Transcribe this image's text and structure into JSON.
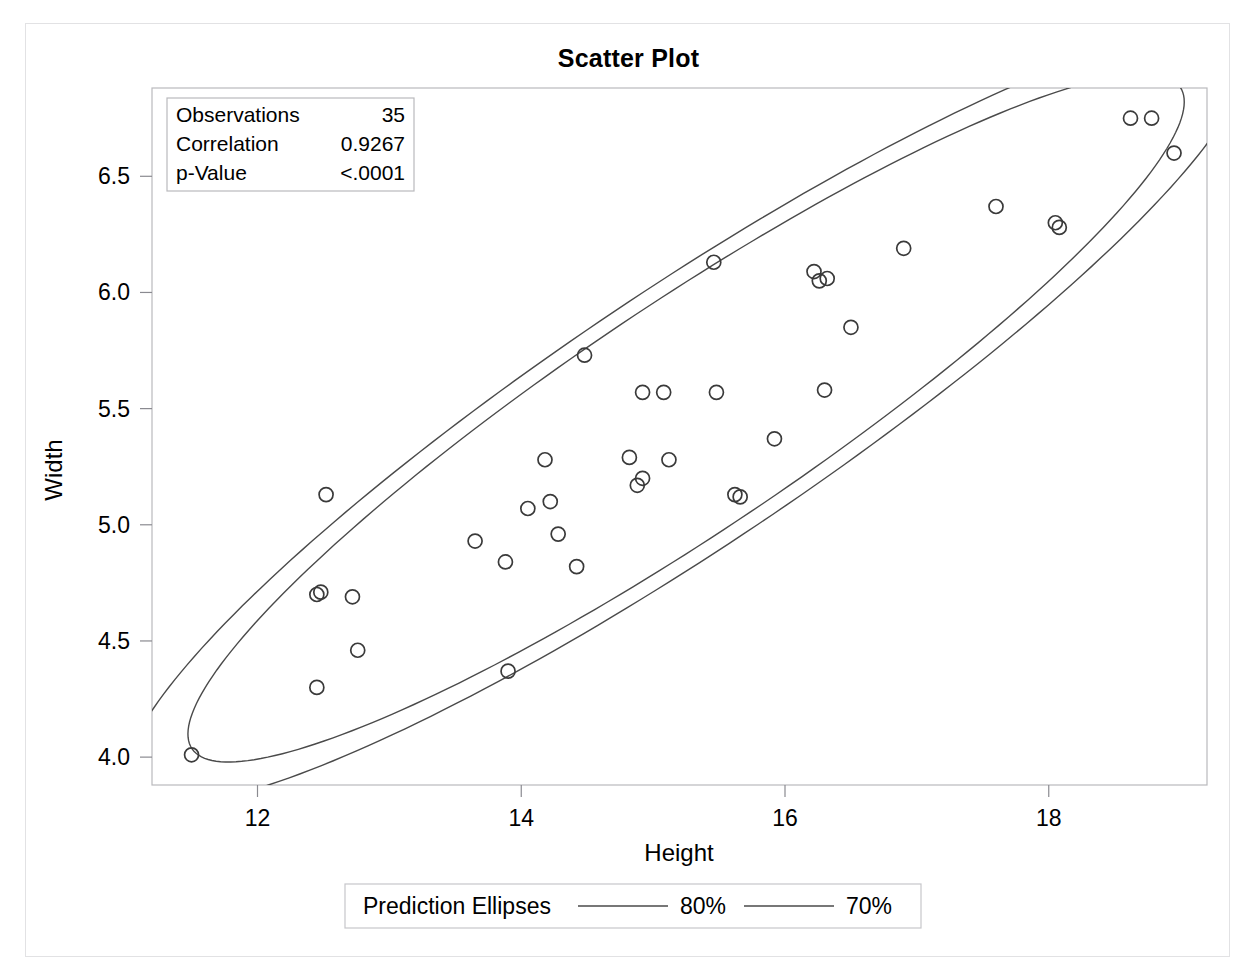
{
  "page": {
    "background_color": "#ffffff",
    "border_color": "#e2e2e4"
  },
  "chart_data": {
    "type": "scatter",
    "title": "Scatter Plot",
    "xlabel": "Height",
    "ylabel": "Width",
    "xlim": [
      11.2,
      19.2
    ],
    "ylim": [
      3.88,
      6.88
    ],
    "xticks": [
      12,
      14,
      16,
      18
    ],
    "xtick_labels": [
      "12",
      "14",
      "16",
      "18"
    ],
    "yticks": [
      4.0,
      4.5,
      5.0,
      5.5,
      6.0,
      6.5
    ],
    "ytick_labels": [
      "4.0",
      "4.5",
      "5.0",
      "5.5",
      "6.0",
      "6.5"
    ],
    "grid": false,
    "marker": "open-circle",
    "marker_color": "#3a3a3a",
    "x": [
      11.5,
      12.45,
      12.45,
      12.48,
      12.52,
      12.72,
      12.76,
      13.65,
      13.88,
      13.9,
      14.05,
      14.18,
      14.22,
      14.28,
      14.42,
      14.48,
      14.82,
      14.88,
      14.92,
      14.92,
      15.08,
      15.12,
      15.46,
      15.48,
      15.62,
      15.66,
      15.92,
      16.22,
      16.26,
      16.3,
      16.32,
      16.5,
      16.9,
      17.6,
      18.05,
      18.08,
      18.62,
      18.78,
      18.95
    ],
    "y": [
      4.01,
      4.3,
      4.7,
      4.71,
      5.13,
      4.69,
      4.46,
      4.93,
      4.84,
      4.37,
      5.07,
      5.28,
      5.1,
      4.96,
      4.82,
      5.73,
      5.29,
      5.17,
      5.2,
      5.57,
      5.57,
      5.28,
      6.13,
      5.57,
      5.13,
      5.12,
      5.37,
      6.09,
      6.05,
      5.58,
      6.06,
      5.85,
      6.19,
      6.37,
      6.3,
      6.28,
      6.75,
      6.75,
      6.6
    ],
    "ellipses": [
      {
        "name": "80%",
        "cx": 15.25,
        "cy": 5.46,
        "semi_major": 4.52,
        "semi_minor": 0.62,
        "angle_deg": 20.2
      },
      {
        "name": "70%",
        "cx": 15.25,
        "cy": 5.46,
        "semi_major": 4.02,
        "semi_minor": 0.55,
        "angle_deg": 20.2
      }
    ],
    "legend": {
      "position": "bottom",
      "title": "Prediction Ellipses",
      "entries": [
        {
          "label": "80%",
          "style": "line",
          "color": "#4a4a4a"
        },
        {
          "label": "70%",
          "style": "line",
          "color": "#4a4a4a"
        }
      ]
    },
    "annotation_box": {
      "rows": [
        {
          "label": "Observations",
          "value": "35"
        },
        {
          "label": "Correlation",
          "value": "0.9267"
        },
        {
          "label": "p-Value",
          "value": "<.0001"
        }
      ]
    }
  }
}
